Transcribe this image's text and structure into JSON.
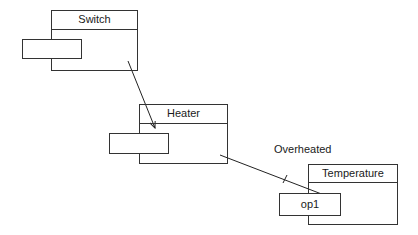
{
  "diagram": {
    "capsules": [
      {
        "id": "switch",
        "name": "Switch",
        "port_label": ""
      },
      {
        "id": "heater",
        "name": "Heater",
        "port_label": ""
      },
      {
        "id": "temperature",
        "name": "Temperature",
        "port_label": "op1"
      }
    ],
    "connections": [
      {
        "from": "switch",
        "to": "heater",
        "label": ""
      },
      {
        "from": "heater",
        "to": "temperature.op1",
        "label": "Overheated"
      }
    ]
  }
}
